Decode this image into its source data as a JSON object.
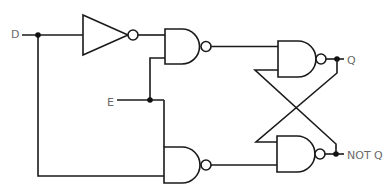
{
  "diagram": {
    "type": "logic-circuit",
    "name_visible": "",
    "labels": {
      "input_d": "D",
      "input_e": "E",
      "output_q": "Q",
      "output_not_q": "NOT Q"
    },
    "components": [
      {
        "id": "inverter",
        "kind": "NOT"
      },
      {
        "id": "nand-top",
        "kind": "NAND"
      },
      {
        "id": "nand-bottom",
        "kind": "NAND"
      },
      {
        "id": "nand-q",
        "kind": "NAND"
      },
      {
        "id": "nand-not-q",
        "kind": "NAND"
      }
    ],
    "colors": {
      "wire": "#1a1a1a",
      "label": "#6b6b6b"
    }
  }
}
